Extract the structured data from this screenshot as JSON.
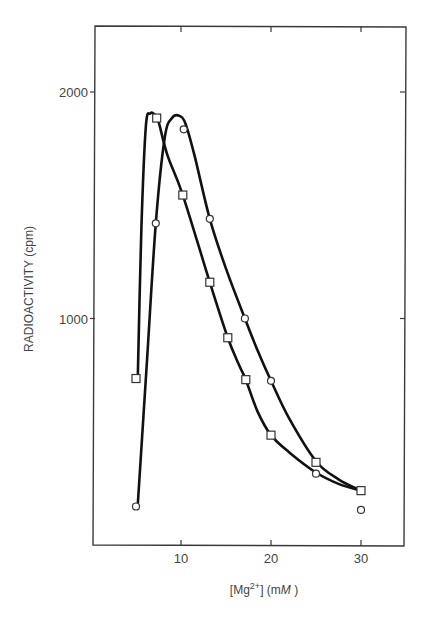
{
  "chart_data": {
    "type": "line",
    "title": "",
    "xlabel": "[Mg2+] (mM)",
    "xlabel_parts": {
      "open": "[Mg",
      "sup": "2+",
      "close": "] (m",
      "italic_unit": "M",
      "end": " )"
    },
    "ylabel": "RADIOACTIVITY (cpm)",
    "xlim": [
      0,
      35
    ],
    "ylim": [
      0,
      2300
    ],
    "x_ticks": [
      10,
      20,
      30
    ],
    "x_tick_labels": [
      "10",
      "20",
      "30"
    ],
    "y_ticks": [
      1000,
      2000
    ],
    "y_tick_labels": [
      "1000",
      "2000"
    ],
    "grid": false,
    "legend": null,
    "series": [
      {
        "name": "squares",
        "marker": "square",
        "points": [
          {
            "x": 5,
            "y": 735
          },
          {
            "x": 7.3,
            "y": 1885
          },
          {
            "x": 10.2,
            "y": 1545
          },
          {
            "x": 13.2,
            "y": 1160
          },
          {
            "x": 15.2,
            "y": 915
          },
          {
            "x": 17.2,
            "y": 730
          },
          {
            "x": 20,
            "y": 485
          },
          {
            "x": 25,
            "y": 365
          },
          {
            "x": 30,
            "y": 240
          }
        ],
        "curve": [
          [
            5.2,
            740
          ],
          [
            5.6,
            1400
          ],
          [
            6.1,
            1850
          ],
          [
            6.6,
            1905
          ],
          [
            7.1,
            1900
          ],
          [
            7.5,
            1870
          ],
          [
            8.5,
            1720
          ],
          [
            10.2,
            1545
          ],
          [
            13.2,
            1160
          ],
          [
            15.2,
            915
          ],
          [
            16.5,
            790
          ],
          [
            17.2,
            730
          ],
          [
            18.5,
            590
          ],
          [
            20,
            485
          ],
          [
            22,
            410
          ],
          [
            25,
            320
          ],
          [
            27.5,
            270
          ],
          [
            30,
            240
          ]
        ]
      },
      {
        "name": "circles",
        "marker": "circle",
        "points": [
          {
            "x": 5,
            "y": 170
          },
          {
            "x": 7.2,
            "y": 1420
          },
          {
            "x": 10.3,
            "y": 1835
          },
          {
            "x": 13.2,
            "y": 1440
          },
          {
            "x": 17.1,
            "y": 1000
          },
          {
            "x": 20,
            "y": 725
          },
          {
            "x": 25,
            "y": 315
          },
          {
            "x": 30,
            "y": 155
          }
        ],
        "curve": [
          [
            5.2,
            180
          ],
          [
            6.2,
            800
          ],
          [
            7.2,
            1420
          ],
          [
            8.2,
            1800
          ],
          [
            9.0,
            1885
          ],
          [
            9.8,
            1895
          ],
          [
            10.5,
            1860
          ],
          [
            11.5,
            1720
          ],
          [
            13.2,
            1440
          ],
          [
            15.0,
            1220
          ],
          [
            17.1,
            1000
          ],
          [
            18.5,
            860
          ],
          [
            20,
            725
          ],
          [
            22,
            560
          ],
          [
            25,
            370
          ],
          [
            27.5,
            290
          ],
          [
            30,
            240
          ]
        ]
      }
    ]
  },
  "layout": {
    "plot_left": 95,
    "plot_right": 405,
    "plot_top": 26,
    "plot_bottom": 546,
    "x0_px": 91,
    "px_per_x": 9.0,
    "y0_px": 545,
    "px_per_y": 0.2265
  }
}
